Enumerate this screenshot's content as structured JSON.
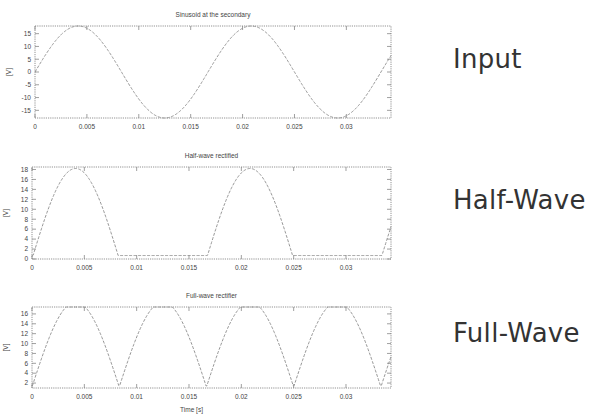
{
  "side_labels": {
    "input": "Input",
    "half_wave": "Half-Wave",
    "full_wave": "Full-Wave"
  },
  "colors": {
    "curve": "#8a8a8a",
    "frame": "#777777",
    "text": "#444444"
  },
  "chart_data": [
    {
      "type": "line",
      "title": "Sinusoid at the secondary",
      "xlabel": "",
      "ylabel": "[V]",
      "xlim": [
        0,
        0.0343
      ],
      "ylim": [
        -18,
        18
      ],
      "xticks": [
        0,
        0.005,
        0.01,
        0.015,
        0.02,
        0.025,
        0.03
      ],
      "xtick_labels": [
        "0",
        "0.005",
        "0.01",
        "0.015",
        "0.02",
        "0.025",
        "0.03"
      ],
      "yticks": [
        -15,
        -10,
        -5,
        0,
        5,
        10,
        15
      ],
      "ytick_labels": [
        "-15",
        "-10",
        "-5",
        "0",
        "5",
        "10",
        "15"
      ],
      "grid": false,
      "series": [
        {
          "name": "secondary voltage",
          "function": "sine",
          "amplitude": 18,
          "frequency_hz": 60,
          "rectify": "none",
          "line_style": "dashed"
        }
      ],
      "frame": {
        "x": 35,
        "y": 26,
        "w": 356,
        "h": 92
      }
    },
    {
      "type": "line",
      "title": "Half-wave rectified",
      "xlabel": "",
      "ylabel": "[V]",
      "xlim": [
        0,
        0.0343
      ],
      "ylim": [
        0,
        18.5
      ],
      "xticks": [
        0,
        0.005,
        0.01,
        0.015,
        0.02,
        0.025,
        0.03
      ],
      "xtick_labels": [
        "0",
        "0.005",
        "0.01",
        "0.015",
        "0.02",
        "0.025",
        "0.03"
      ],
      "yticks": [
        0,
        2,
        4,
        6,
        8,
        10,
        12,
        14,
        16,
        18
      ],
      "ytick_labels": [
        "0",
        "2",
        "4",
        "6",
        "8",
        "10",
        "12",
        "14",
        "16",
        "18"
      ],
      "grid": false,
      "series": [
        {
          "name": "half-wave output",
          "function": "sine",
          "amplitude": 18.2,
          "frequency_hz": 60,
          "rectify": "half",
          "diode_drop": 0.7,
          "line_style": "dashed"
        }
      ],
      "frame": {
        "x": 32,
        "y": 167,
        "w": 359,
        "h": 92
      }
    },
    {
      "type": "line",
      "title": "Full-wave rectifier",
      "xlabel": "Time [s]",
      "ylabel": "[V]",
      "xlim": [
        0,
        0.0343
      ],
      "ylim": [
        1,
        17.4
      ],
      "xticks": [
        0,
        0.005,
        0.01,
        0.015,
        0.02,
        0.025,
        0.03
      ],
      "xtick_labels": [
        "0",
        "0.005",
        "0.01",
        "0.015",
        "0.02",
        "0.025",
        "0.03"
      ],
      "yticks": [
        2,
        4,
        6,
        8,
        10,
        12,
        14,
        16
      ],
      "ytick_labels": [
        "2",
        "4",
        "6",
        "8",
        "10",
        "12",
        "14",
        "16"
      ],
      "grid": false,
      "series": [
        {
          "name": "full-wave output",
          "function": "sine",
          "amplitude": 17.2,
          "frequency_hz": 60,
          "rectify": "full",
          "diode_drop": 1.4,
          "line_style": "dashed"
        }
      ],
      "frame": {
        "x": 32,
        "y": 307,
        "w": 359,
        "h": 81
      }
    }
  ]
}
